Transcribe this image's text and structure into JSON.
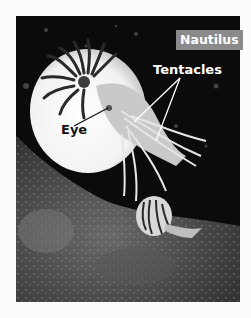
{
  "figure": {
    "title": "Nautilus",
    "labels": [
      {
        "id": "tentacles",
        "text": "Tentacles",
        "color": "#ffffff",
        "pointer_count": 2
      },
      {
        "id": "eye",
        "text": "Eye",
        "color": "#111111",
        "pointer_count": 1
      }
    ],
    "colors": {
      "badge_bg": "#8a8a8a",
      "badge_text": "#ffffff",
      "page_bg": "#fbfbfb",
      "photo_bg": "#0b0b0b"
    }
  }
}
